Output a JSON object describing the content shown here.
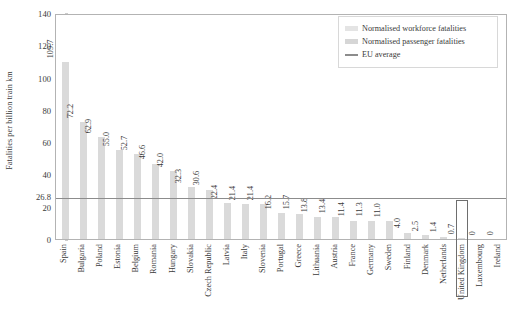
{
  "chart_data": {
    "type": "bar",
    "title": "",
    "xlabel": "",
    "ylabel": "Fatalities per billion train km",
    "ylim": [
      0,
      140
    ],
    "yticks": [
      0,
      20,
      26.8,
      40,
      60,
      80,
      100,
      120,
      140
    ],
    "ytick_labels": [
      "0",
      "20",
      "26.8",
      "40",
      "60",
      "80",
      "100",
      "120",
      "140"
    ],
    "grid": false,
    "legend_position": "top-right",
    "categories": [
      "Spain",
      "Bulgaria",
      "Poland",
      "Estonia",
      "Belgium",
      "Romania",
      "Hungary",
      "Slovakia",
      "Czech Republic",
      "Latvia",
      "Italy",
      "Slovenia",
      "Portugal",
      "Greece",
      "Lithuania",
      "Austria",
      "France",
      "Germany",
      "Sweden",
      "Finland",
      "Denmark",
      "Netherlands",
      "United Kingdom",
      "Luxembourg",
      "Ireland"
    ],
    "values": [
      109.7,
      72.2,
      62.9,
      55.0,
      52.7,
      46.6,
      42.0,
      32.3,
      30.6,
      22.4,
      21.4,
      21.4,
      16.2,
      15.7,
      13.8,
      13.4,
      11.4,
      11.3,
      11.0,
      4.0,
      2.5,
      1.4,
      0.7,
      0,
      0
    ],
    "value_labels": [
      "109.7",
      "72.2",
      "62.9",
      "55.0",
      "52.7",
      "46.6",
      "42.0",
      "32.3",
      "30.6",
      "22.4",
      "21.4",
      "21.4",
      "16.2",
      "15.7",
      "13.8",
      "13.4",
      "11.4",
      "11.3",
      "11.0",
      "4.0",
      "2.5",
      "1.4",
      "0.7",
      "0",
      "0"
    ],
    "reference_line": {
      "name": "EU average",
      "value": 26.8,
      "color": "#8c8c8c"
    },
    "highlighted_category": "United Kingdom",
    "series": [
      {
        "name": "Normalised workforce fatalities",
        "color": "#e4e4e4"
      },
      {
        "name": "Normalised passenger fatalities",
        "color": "#d6d6d6"
      }
    ]
  },
  "legend": {
    "items": [
      {
        "label": "Normalised workforce fatalities",
        "swatch": "#e4e4e4",
        "kind": "box"
      },
      {
        "label": "Normalised passenger fatalities",
        "swatch": "#d6d6d6",
        "kind": "box"
      },
      {
        "label": "EU average",
        "swatch": "#8c8c8c",
        "kind": "line"
      }
    ]
  },
  "colors": {
    "bar": "#dadada",
    "reference_line": "#8c8c8c",
    "axis": "#b3b3b3",
    "text": "#3a3a3a",
    "highlight_border": "#6e6e6e"
  }
}
